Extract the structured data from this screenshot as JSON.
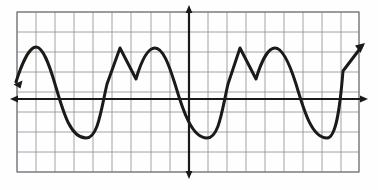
{
  "figure": {
    "kind": "graph-paper-waveform",
    "background_color": "#fefefe",
    "title": "",
    "caption": ""
  },
  "grid": {
    "line_color": "#8d8d96",
    "line_width": 0.8,
    "border_color": "#6f6f78",
    "border_width": 1.1,
    "cell_width": 19,
    "cell_height": 19,
    "left": 17,
    "top": 12,
    "right": 359,
    "bottom": 172,
    "columns": 18,
    "rows": 8,
    "visible": true
  },
  "axes": {
    "color": "#1a1a1a",
    "line_width": 2.2,
    "x_axis": {
      "label": "",
      "y_pixel": 99,
      "x_start": 14,
      "x_end": 364,
      "arrow_left": true,
      "arrow_right": true,
      "tick_labels": []
    },
    "y_axis": {
      "label": "",
      "x_pixel": 189,
      "y_start": 9,
      "y_end": 175,
      "arrow_top": true,
      "arrow_bottom": true,
      "tick_labels": []
    }
  },
  "chart_data": {
    "type": "line",
    "title": "",
    "subtitle": "",
    "xlabel": "",
    "ylabel": "",
    "grid": true,
    "legend": null,
    "legend_position": "none",
    "xlim": [
      -9,
      9
    ],
    "ylim": [
      -4,
      4
    ],
    "xticks": [
      -9,
      -8,
      -7,
      -6,
      -5,
      -4,
      -3,
      -2,
      -1,
      0,
      1,
      2,
      3,
      4,
      5,
      6,
      7,
      8,
      9
    ],
    "yticks": [
      -4,
      -3,
      -2,
      -1,
      0,
      1,
      2,
      3,
      4
    ],
    "xtick_labels": [],
    "ytick_labels": [],
    "series": [
      {
        "name": "waveform",
        "color": "#1a1a1a",
        "line_width": 3.0,
        "style": "solid",
        "marker": "none",
        "description": "Periodic wave with period 8 units: rounded crest at +2.7, deep rounded trough at -2.0, sharp triangular crest at +2.7, V-notch down to +1.1, rounded crest at +2.7, then back to trough.",
        "period_units": 8,
        "crest_value": 2.7,
        "trough_value": -2.0,
        "notch_value": 1.1,
        "x": [
          -9.05,
          -8.2,
          -7.5,
          -6.8,
          -6.1,
          -5.4,
          -4.85,
          -4.3,
          -3.8,
          -3.4,
          -2.95,
          -2.45,
          -1.9,
          -1.3,
          -0.75,
          -0.2,
          0.35,
          0.9,
          1.45,
          2.0,
          2.5,
          2.95,
          3.4,
          3.85,
          4.4,
          4.9,
          5.45,
          6.0,
          6.55,
          7.05,
          7.5,
          7.95,
          8.45,
          9.0
        ],
        "y": [
          0.9,
          2.45,
          2.72,
          2.3,
          1.15,
          -0.6,
          -1.65,
          -2.0,
          -1.6,
          -0.2,
          1.35,
          2.35,
          2.72,
          1.75,
          1.1,
          2.25,
          2.72,
          2.3,
          1.0,
          -0.85,
          -1.85,
          -2.0,
          -1.45,
          0.25,
          1.9,
          2.72,
          2.2,
          1.1,
          2.35,
          2.72,
          1.9,
          0.0,
          -1.8,
          -2.0
        ]
      }
    ],
    "annotations": [
      {
        "name": "left-end-arrow",
        "at_x": -9.05,
        "at_y": 0.9,
        "kind": "arrow-cap"
      },
      {
        "name": "right-end-arrow",
        "at_x": 9.15,
        "at_y": 2.8,
        "kind": "arrow-cap"
      }
    ]
  },
  "curve": {
    "color": "#1a1a1a",
    "line_width": 3.0,
    "path": "M 16 82 C 21 66, 29 47, 36 47 C 43 47, 49 64, 55 84 C 63 111, 70 138, 86 138 C 98 138, 101 110, 107 84 L 120 48 L 136 79 C 141 62, 147 48, 155 48 C 163 48, 169 65, 175 84 C 183 111, 192 138, 207 138 C 219 138, 222 110, 228 84 L 240 48 L 256 79 C 261 62, 268 48, 275 48 C 283 48, 290 65, 296 84 C 304 111, 312 138, 327 138 C 336 138, 340 108, 343 71 L 362 46",
    "start_cap": {
      "x": 16,
      "y": 82,
      "arrow": true,
      "angle_deg": 196
    },
    "end_cap": {
      "x": 362,
      "y": 46,
      "arrow": true,
      "angle_deg": -53
    }
  }
}
